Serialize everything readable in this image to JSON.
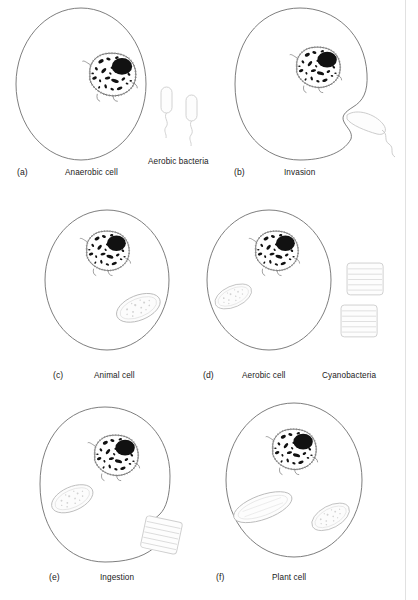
{
  "figure": {
    "background_color": "#ffffff",
    "ink_color": "#4a4a4a",
    "dark_fill": "#111111",
    "faint_color": "#d8d8d8"
  },
  "panels": [
    {
      "id": "a",
      "letter": "(a)",
      "label": "Anaerobic cell",
      "extra_label": "Aerobic bacteria",
      "contents": [
        "cell-membrane",
        "nucleus",
        "free-bacteria"
      ]
    },
    {
      "id": "b",
      "letter": "(b)",
      "label": "Invasion",
      "extra_label": "",
      "contents": [
        "cell-membrane-indented",
        "nucleus",
        "invading-bacterium"
      ]
    },
    {
      "id": "c",
      "letter": "(c)",
      "label": "Animal cell",
      "extra_label": "",
      "contents": [
        "cell-membrane",
        "nucleus",
        "mitochondrion"
      ]
    },
    {
      "id": "d",
      "letter": "(d)",
      "label": "Aerobic cell",
      "extra_label": "Cyanobacteria",
      "contents": [
        "cell-membrane",
        "nucleus",
        "mitochondrion",
        "free-cyanobacteria"
      ]
    },
    {
      "id": "e",
      "letter": "(e)",
      "label": "Ingestion",
      "extra_label": "",
      "contents": [
        "cell-membrane-pocket",
        "nucleus",
        "mitochondrion",
        "ingested-cyanobacterium"
      ]
    },
    {
      "id": "f",
      "letter": "(f)",
      "label": "Plant cell",
      "extra_label": "",
      "contents": [
        "cell-membrane",
        "nucleus",
        "chloroplast",
        "mitochondrion"
      ]
    }
  ],
  "organelles": {
    "nucleus_name": "nucleus",
    "nucleolus_name": "nucleolus",
    "mitochondrion_name": "mitochondrion",
    "chloroplast_name": "chloroplast",
    "bacterium_name": "aerobic bacterium",
    "cyanobacterium_name": "cyanobacterium"
  }
}
